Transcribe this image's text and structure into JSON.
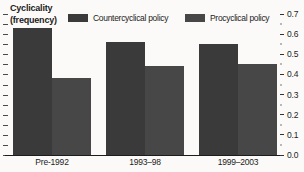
{
  "title": {
    "line1": "Cyclicality",
    "line2": "(frequency)"
  },
  "legend": [
    {
      "label": "Countercyclical policy",
      "color": "#3a3a3a"
    },
    {
      "label": "Procyclical policy",
      "color": "#474747"
    }
  ],
  "chart_data": {
    "type": "bar",
    "title": "Cyclicality (frequency)",
    "categories": [
      "Pre-1992",
      "1993–98",
      "1999–2003"
    ],
    "series": [
      {
        "name": "Countercyclical policy",
        "color": "#3a3a3a",
        "values": [
          0.63,
          0.56,
          0.55
        ]
      },
      {
        "name": "Procyclical policy",
        "color": "#474747",
        "values": [
          0.38,
          0.44,
          0.45
        ]
      }
    ],
    "xlabel": "",
    "ylabel": "Cyclicality (frequency)",
    "ylim": [
      0,
      0.7
    ],
    "ytick_step": 0.1,
    "yminor_step": 0.05,
    "ytick_labels": [
      "0.7",
      "0.6",
      "0.5",
      "0.4",
      "0.3",
      "0.2",
      "0.1",
      "0.0"
    ],
    "yaxis_side": "right",
    "legend_position": "top",
    "grid": false
  }
}
